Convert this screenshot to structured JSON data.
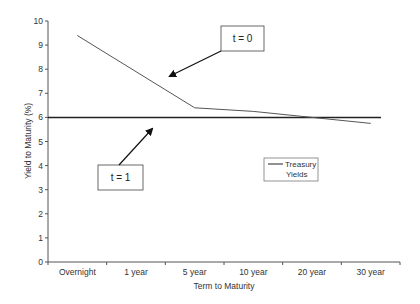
{
  "chart_data": {
    "type": "line",
    "title": "",
    "xlabel": "Term to Maturity",
    "ylabel": "Yield to Maturity (%)",
    "ylim": [
      0,
      10
    ],
    "yticks": [
      0,
      1,
      2,
      3,
      4,
      5,
      6,
      7,
      8,
      9,
      10
    ],
    "grid": false,
    "categories": [
      "Overnight",
      "1 year",
      "5 year",
      "10 year",
      "20 year",
      "30 year"
    ],
    "series": [
      {
        "name": "Treasury Yields",
        "values": [
          9.4,
          null,
          6.4,
          6.25,
          6.0,
          5.75
        ],
        "color": "#444444"
      },
      {
        "name": "t = 1 (flat)",
        "values": [
          6.0,
          6.0,
          6.0,
          6.0,
          6.0,
          6.0
        ],
        "color": "#222222"
      }
    ],
    "annotations": [
      {
        "text": "t = 0",
        "points_to": "Treasury Yields curve"
      },
      {
        "text": "t = 1",
        "points_to": "flat 6% line"
      }
    ],
    "legend": {
      "entries": [
        "Treasury",
        "Yields"
      ],
      "position": "inside-right"
    }
  }
}
